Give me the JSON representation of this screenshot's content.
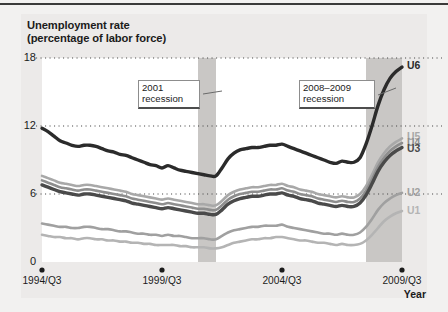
{
  "figure": {
    "title_line1": "Unemployment rate",
    "title_line2": "(percentage of labor force)",
    "year_axis_label": "Year",
    "background": "#f2f1f0",
    "panel_background": "#ffffff",
    "recession_band_color": "#c9c7c5"
  },
  "annotations": [
    {
      "name": "recession-2001",
      "line1": "2001",
      "line2": "recession"
    },
    {
      "name": "recession-2008-2009",
      "line1": "2008–2009",
      "line2": "recession"
    }
  ],
  "axis": {
    "y_ticks": [
      "0",
      "6",
      "12",
      "18"
    ],
    "x_ticks": [
      "1994/Q3",
      "1999/Q3",
      "2004/Q3",
      "2009/Q3"
    ]
  },
  "legend": [
    {
      "label": "U6",
      "color": "#2b2b2b"
    },
    {
      "label": "U5",
      "color": "#a8a8a8"
    },
    {
      "label": "U4",
      "color": "#8e8e8e"
    },
    {
      "label": "U3",
      "color": "#4a4a4a"
    },
    {
      "label": "U2",
      "color": "#a0a0a0"
    },
    {
      "label": "U1",
      "color": "#b4b4b4"
    }
  ],
  "chart_data": {
    "type": "line",
    "title": "Unemployment rate (percentage of labor force)",
    "xlabel": "Year",
    "ylabel": "percentage of labor force",
    "ylim": [
      0,
      18
    ],
    "y_ticks": [
      0,
      6,
      12,
      18
    ],
    "grid": "horizontal dotted gridlines at 6, 12, 18",
    "legend_position": "right of plot, at series end",
    "x_tick_labels": [
      "1994/Q3",
      "1999/Q3",
      "2004/Q3",
      "2009/Q3"
    ],
    "x_tick_quarters": [
      0,
      20,
      40,
      60
    ],
    "x_unit": "quarters since 1994/Q3",
    "x": [
      0,
      1,
      2,
      3,
      4,
      5,
      6,
      7,
      8,
      9,
      10,
      11,
      12,
      13,
      14,
      15,
      16,
      17,
      18,
      19,
      20,
      21,
      22,
      23,
      24,
      25,
      26,
      27,
      28,
      29,
      30,
      31,
      32,
      33,
      34,
      35,
      36,
      37,
      38,
      39,
      40,
      41,
      42,
      43,
      44,
      45,
      46,
      47,
      48,
      49,
      50,
      51,
      52,
      53,
      54,
      55,
      56,
      57,
      58,
      59,
      60
    ],
    "shaded_regions": [
      {
        "label": "2001 recession",
        "x_start": 26,
        "x_end": 29
      },
      {
        "label": "2008-2009 recession",
        "x_start": 54,
        "x_end": 60
      }
    ],
    "annotation_texts": [
      "2001 recession",
      "2008–2009 recession"
    ],
    "series": [
      {
        "name": "U6",
        "color": "#2b2b2b",
        "values": [
          11.8,
          11.5,
          11.1,
          10.7,
          10.5,
          10.3,
          10.2,
          10.3,
          10.3,
          10.2,
          10.0,
          9.8,
          9.7,
          9.5,
          9.4,
          9.2,
          9.0,
          8.8,
          8.6,
          8.5,
          8.3,
          8.5,
          8.3,
          8.1,
          8.0,
          7.9,
          7.8,
          7.7,
          7.6,
          7.6,
          8.3,
          9.1,
          9.6,
          9.9,
          10.0,
          10.1,
          10.1,
          10.2,
          10.3,
          10.3,
          10.4,
          10.2,
          10.0,
          9.8,
          9.6,
          9.4,
          9.2,
          9.0,
          8.8,
          8.7,
          8.9,
          8.8,
          8.8,
          9.2,
          10.4,
          12.0,
          13.8,
          15.2,
          16.2,
          16.8,
          17.2
        ]
      },
      {
        "name": "U5",
        "color": "#a8a8a8",
        "values": [
          7.6,
          7.4,
          7.2,
          7.0,
          6.9,
          6.8,
          6.7,
          6.8,
          6.8,
          6.7,
          6.6,
          6.5,
          6.4,
          6.3,
          6.2,
          6.0,
          5.9,
          5.8,
          5.7,
          5.6,
          5.5,
          5.6,
          5.5,
          5.4,
          5.3,
          5.2,
          5.1,
          5.1,
          5.0,
          5.0,
          5.4,
          5.9,
          6.2,
          6.4,
          6.5,
          6.6,
          6.6,
          6.7,
          6.8,
          6.8,
          6.9,
          6.7,
          6.6,
          6.4,
          6.3,
          6.2,
          6.0,
          5.9,
          5.8,
          5.7,
          5.8,
          5.7,
          5.7,
          6.0,
          6.7,
          7.7,
          8.8,
          9.6,
          10.2,
          10.6,
          10.9
        ]
      },
      {
        "name": "U4",
        "color": "#8e8e8e",
        "values": [
          7.2,
          7.0,
          6.8,
          6.6,
          6.5,
          6.4,
          6.3,
          6.4,
          6.4,
          6.3,
          6.2,
          6.1,
          6.0,
          5.9,
          5.8,
          5.6,
          5.5,
          5.4,
          5.3,
          5.2,
          5.1,
          5.2,
          5.1,
          5.0,
          4.9,
          4.8,
          4.7,
          4.7,
          4.6,
          4.6,
          5.0,
          5.5,
          5.8,
          6.0,
          6.1,
          6.2,
          6.2,
          6.3,
          6.4,
          6.4,
          6.5,
          6.3,
          6.2,
          6.0,
          5.9,
          5.8,
          5.6,
          5.5,
          5.4,
          5.3,
          5.4,
          5.3,
          5.3,
          5.6,
          6.3,
          7.3,
          8.4,
          9.2,
          9.8,
          10.2,
          10.5
        ]
      },
      {
        "name": "U3",
        "color": "#4a4a4a",
        "values": [
          6.8,
          6.6,
          6.4,
          6.2,
          6.1,
          6.0,
          5.9,
          6.0,
          6.0,
          5.9,
          5.8,
          5.7,
          5.6,
          5.5,
          5.4,
          5.2,
          5.1,
          5.0,
          4.9,
          4.8,
          4.7,
          4.8,
          4.7,
          4.6,
          4.5,
          4.4,
          4.3,
          4.3,
          4.2,
          4.2,
          4.6,
          5.1,
          5.4,
          5.6,
          5.7,
          5.8,
          5.8,
          5.9,
          6.0,
          6.0,
          6.1,
          5.9,
          5.8,
          5.6,
          5.5,
          5.4,
          5.2,
          5.1,
          5.0,
          4.9,
          5.0,
          4.9,
          4.9,
          5.2,
          5.9,
          6.9,
          8.0,
          8.8,
          9.4,
          9.8,
          10.1
        ]
      },
      {
        "name": "U2",
        "color": "#a0a0a0",
        "values": [
          3.4,
          3.3,
          3.2,
          3.1,
          3.1,
          3.0,
          3.0,
          3.1,
          3.1,
          3.0,
          2.9,
          2.9,
          2.8,
          2.7,
          2.7,
          2.6,
          2.5,
          2.5,
          2.4,
          2.4,
          2.3,
          2.4,
          2.3,
          2.3,
          2.2,
          2.1,
          2.1,
          2.1,
          2.0,
          2.0,
          2.3,
          2.6,
          2.8,
          2.9,
          3.0,
          3.1,
          3.1,
          3.2,
          3.2,
          3.2,
          3.3,
          3.1,
          3.0,
          2.9,
          2.8,
          2.7,
          2.6,
          2.5,
          2.5,
          2.4,
          2.5,
          2.4,
          2.4,
          2.6,
          3.1,
          3.8,
          4.6,
          5.2,
          5.6,
          5.9,
          6.1
        ]
      },
      {
        "name": "U1",
        "color": "#b4b4b4",
        "values": [
          2.4,
          2.3,
          2.2,
          2.2,
          2.1,
          2.1,
          2.0,
          2.1,
          2.1,
          2.0,
          2.0,
          1.9,
          1.9,
          1.8,
          1.8,
          1.7,
          1.7,
          1.6,
          1.6,
          1.5,
          1.5,
          1.5,
          1.5,
          1.4,
          1.4,
          1.3,
          1.3,
          1.3,
          1.2,
          1.2,
          1.3,
          1.5,
          1.7,
          1.8,
          1.9,
          2.0,
          2.0,
          2.1,
          2.1,
          2.2,
          2.2,
          2.1,
          2.0,
          1.9,
          1.9,
          1.8,
          1.7,
          1.7,
          1.6,
          1.5,
          1.6,
          1.5,
          1.5,
          1.6,
          1.9,
          2.4,
          3.0,
          3.6,
          4.0,
          4.3,
          4.5
        ]
      }
    ]
  }
}
